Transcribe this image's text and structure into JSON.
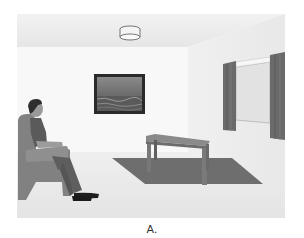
{
  "figure": {
    "caption": "A.",
    "scene": {
      "description": "Living room with a seated man in an armchair facing a wall painting, a coffee table on a rug, a ceiling lamp, and a curtained window",
      "objects": [
        {
          "name": "ceiling-lamp"
        },
        {
          "name": "framed-painting",
          "subject": "seascape"
        },
        {
          "name": "man-seated"
        },
        {
          "name": "armchair"
        },
        {
          "name": "coffee-table"
        },
        {
          "name": "rug"
        },
        {
          "name": "window"
        },
        {
          "name": "curtain-left"
        },
        {
          "name": "curtain-right"
        }
      ]
    },
    "colors": {
      "ceiling": "#ececec",
      "back_wall": "#f7f7f7",
      "side_wall": "#eeeeee",
      "floor": "#e9e9e9",
      "rug": "#6e6e6e",
      "furniture": "#7e7e7e",
      "curtain": "#6a6a6a",
      "painting_frame": "#2a2a2a"
    }
  }
}
